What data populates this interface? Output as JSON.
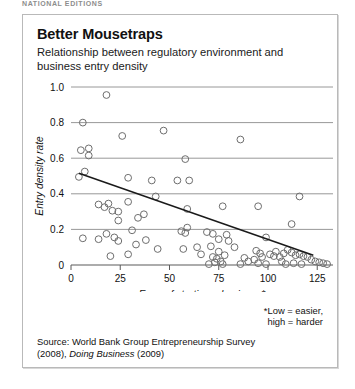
{
  "page_header": "NATIONAL EDITIONS",
  "chart_data": {
    "type": "scatter",
    "title": "Better Mousetraps",
    "subtitle": "Relationship between regulatory environment and business entry density",
    "xlabel": "Ease of starting a business*",
    "ylabel": "Entry density rate",
    "xlim": [
      0,
      133
    ],
    "ylim": [
      0,
      1.0
    ],
    "xticks": [
      0,
      25,
      50,
      75,
      100,
      125
    ],
    "xtick_labels": [
      "0",
      "25",
      "50",
      "75",
      "100",
      "125"
    ],
    "yticks": [
      0,
      0.2,
      0.4,
      0.6,
      0.8,
      1.0
    ],
    "ytick_labels": [
      "0",
      "0.2",
      "0.4",
      "0.6",
      "0.8",
      "1.0"
    ],
    "grid": "horizontal",
    "legend": "none",
    "marker": "open-circle",
    "footnote": "*Low = easier,\nhigh = harder",
    "footnote_line1": "*Low = easier,",
    "footnote_line2": "high = harder",
    "source_line1": "Source: World Bank Group Entrepreneurship Survey",
    "source_line2_prefix": "(2008), ",
    "source_line2_italic": "Doing Business",
    "source_line2_suffix": " (2009)",
    "trendline": {
      "label": "linear fit",
      "x_start": 4,
      "y_start": 0.515,
      "x_end": 123,
      "y_end": 0.055
    },
    "points": [
      [
        18,
        0.955
      ],
      [
        6,
        0.8
      ],
      [
        26,
        0.725
      ],
      [
        47,
        0.755
      ],
      [
        86,
        0.705
      ],
      [
        5,
        0.645
      ],
      [
        9,
        0.655
      ],
      [
        9,
        0.615
      ],
      [
        58,
        0.595
      ],
      [
        4,
        0.495
      ],
      [
        7,
        0.525
      ],
      [
        29,
        0.49
      ],
      [
        41,
        0.475
      ],
      [
        54,
        0.475
      ],
      [
        60,
        0.475
      ],
      [
        116,
        0.385
      ],
      [
        43,
        0.385
      ],
      [
        29,
        0.355
      ],
      [
        14,
        0.34
      ],
      [
        19,
        0.345
      ],
      [
        17,
        0.325
      ],
      [
        21,
        0.305
      ],
      [
        24,
        0.3
      ],
      [
        59,
        0.315
      ],
      [
        77,
        0.33
      ],
      [
        95,
        0.33
      ],
      [
        24,
        0.25
      ],
      [
        34,
        0.265
      ],
      [
        37,
        0.285
      ],
      [
        112,
        0.23
      ],
      [
        31,
        0.195
      ],
      [
        59,
        0.21
      ],
      [
        56,
        0.19
      ],
      [
        58,
        0.18
      ],
      [
        69,
        0.185
      ],
      [
        72,
        0.175
      ],
      [
        79,
        0.17
      ],
      [
        6,
        0.15
      ],
      [
        14,
        0.145
      ],
      [
        18,
        0.175
      ],
      [
        22,
        0.155
      ],
      [
        24,
        0.135
      ],
      [
        33,
        0.115
      ],
      [
        38,
        0.14
      ],
      [
        75,
        0.145
      ],
      [
        80,
        0.135
      ],
      [
        83,
        0.1
      ],
      [
        71,
        0.105
      ],
      [
        99,
        0.155
      ],
      [
        20,
        0.05
      ],
      [
        29,
        0.06
      ],
      [
        57,
        0.09
      ],
      [
        75,
        0.075
      ],
      [
        78,
        0.055
      ],
      [
        72,
        0.045
      ],
      [
        74,
        0.035
      ],
      [
        76,
        0.02
      ],
      [
        73,
        0.015
      ],
      [
        77,
        0.005
      ],
      [
        70,
        0.005
      ],
      [
        94,
        0.08
      ],
      [
        96,
        0.065
      ],
      [
        97,
        0.045
      ],
      [
        93,
        0.03
      ],
      [
        95,
        0.01
      ],
      [
        99,
        0.005
      ],
      [
        101,
        0.06
      ],
      [
        103,
        0.05
      ],
      [
        104,
        0.075
      ],
      [
        106,
        0.045
      ],
      [
        108,
        0.065
      ],
      [
        110,
        0.085
      ],
      [
        112,
        0.07
      ],
      [
        107,
        0.02
      ],
      [
        109,
        0.005
      ],
      [
        114,
        0.055
      ],
      [
        116,
        0.06
      ],
      [
        118,
        0.05
      ],
      [
        120,
        0.045
      ],
      [
        122,
        0.03
      ],
      [
        124,
        0.02
      ],
      [
        126,
        0.015
      ],
      [
        128,
        0.01
      ],
      [
        130,
        0.005
      ],
      [
        117,
        0.005
      ],
      [
        113,
        0.01
      ],
      [
        86,
        0.005
      ],
      [
        88,
        0.04
      ],
      [
        90,
        0.02
      ],
      [
        64,
        0.1
      ],
      [
        66,
        0.06
      ],
      [
        44,
        0.09
      ]
    ]
  }
}
